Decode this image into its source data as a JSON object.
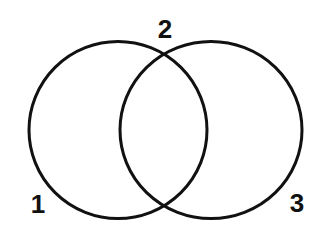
{
  "diagram": {
    "type": "venn",
    "stroke_color": "#111111",
    "background_color": "#ffffff",
    "circles": [
      {
        "id": "left",
        "cx": 118,
        "cy": 130,
        "rx": 89,
        "ry": 88.5
      },
      {
        "id": "right",
        "cx": 211,
        "cy": 130,
        "rx": 91,
        "ry": 88.5
      }
    ],
    "labels": [
      {
        "text": "1",
        "x": 38,
        "y": 213
      },
      {
        "text": "2",
        "x": 165,
        "y": 38
      },
      {
        "text": "3",
        "x": 297,
        "y": 212
      }
    ]
  }
}
